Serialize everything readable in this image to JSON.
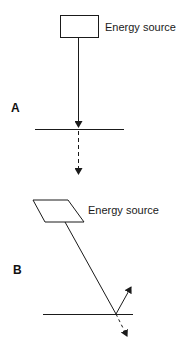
{
  "diagram": {
    "panels": [
      {
        "label": "A",
        "source_label": "Energy source",
        "description": "Energy source directly above surface; incident ray perpendicular, transmitted ray continues straight (dashed)"
      },
      {
        "label": "B",
        "source_label": "Energy source",
        "description": "Energy source at an angle; incident ray oblique, partly reflected (solid arrow) and partly transmitted (dashed arrow)"
      }
    ],
    "colors": {
      "stroke": "#1a1a1a",
      "background": "#ffffff"
    }
  }
}
